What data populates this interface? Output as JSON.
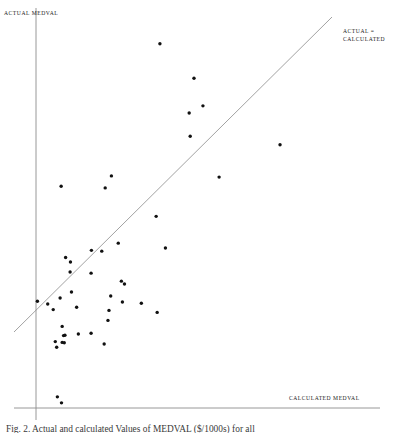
{
  "figure": {
    "background_color": "#ffffff",
    "ink_color": "#1a1a1a",
    "axis_color": "#888888",
    "caption": "Fig. 2. Actual and calculated Values of MEDVAL ($/1000s) for all"
  },
  "chart_data": {
    "type": "scatter",
    "title": "",
    "xlabel": "CALCULATED MEDVAL",
    "ylabel": "ACTUAL MEDVAL",
    "xlim": [
      0,
      100
    ],
    "ylim": [
      0,
      100
    ],
    "grid": false,
    "legend_position": "upper-right-inline",
    "marker": {
      "shape": "circle",
      "color": "#111111",
      "size_px": 3.4
    },
    "reference_line": {
      "label": "ACTUAL = CALCULATED",
      "type": "identity",
      "slope": 1,
      "intercept": 0,
      "color": "#8a8a8a",
      "x_start": -6.4,
      "y_start": 19.0,
      "x_end": 86.0,
      "y_end": 97.7
    },
    "axes": {
      "x_axis_start_px": 14,
      "x_axis_end_px": 380,
      "x_axis_y_px": 408,
      "y_axis_x_px": 36,
      "y_axis_top_px": 8,
      "y_axis_bottom_px": 420
    },
    "n_points": 56,
    "points": [
      {
        "x": 36.0,
        "y": 91.0
      },
      {
        "x": 45.9,
        "y": 82.4
      },
      {
        "x": 48.5,
        "y": 75.5
      },
      {
        "x": 44.5,
        "y": 73.7
      },
      {
        "x": 44.8,
        "y": 67.9
      },
      {
        "x": 70.9,
        "y": 65.8
      },
      {
        "x": 53.2,
        "y": 57.7
      },
      {
        "x": 21.9,
        "y": 58.0
      },
      {
        "x": 7.3,
        "y": 55.4
      },
      {
        "x": 20.1,
        "y": 55.0
      },
      {
        "x": 34.9,
        "y": 47.9
      },
      {
        "x": 23.9,
        "y": 41.2
      },
      {
        "x": 37.6,
        "y": 40.0
      },
      {
        "x": 16.1,
        "y": 39.4
      },
      {
        "x": 19.1,
        "y": 39.2
      },
      {
        "x": 8.6,
        "y": 37.6
      },
      {
        "x": 10.0,
        "y": 36.5
      },
      {
        "x": 9.9,
        "y": 34.0
      },
      {
        "x": 16.0,
        "y": 33.7
      },
      {
        "x": 24.8,
        "y": 31.7
      },
      {
        "x": 25.7,
        "y": 31.0
      },
      {
        "x": 10.3,
        "y": 29.0
      },
      {
        "x": 7.0,
        "y": 27.5
      },
      {
        "x": 21.7,
        "y": 28.0
      },
      {
        "x": 25.1,
        "y": 26.5
      },
      {
        "x": 30.6,
        "y": 26.2
      },
      {
        "x": 0.4,
        "y": 26.7
      },
      {
        "x": 3.4,
        "y": 26.0
      },
      {
        "x": 11.8,
        "y": 25.2
      },
      {
        "x": 5.0,
        "y": 24.6
      },
      {
        "x": 21.2,
        "y": 24.4
      },
      {
        "x": 35.2,
        "y": 23.9
      },
      {
        "x": 20.9,
        "y": 21.9
      },
      {
        "x": 7.6,
        "y": 20.4
      },
      {
        "x": 12.3,
        "y": 18.5
      },
      {
        "x": 16.0,
        "y": 18.7
      },
      {
        "x": 8.0,
        "y": 18.1
      },
      {
        "x": 8.4,
        "y": 18.2
      },
      {
        "x": 5.6,
        "y": 16.6
      },
      {
        "x": 7.6,
        "y": 16.4
      },
      {
        "x": 8.2,
        "y": 16.3
      },
      {
        "x": 19.8,
        "y": 16.0
      },
      {
        "x": 6.0,
        "y": 15.2
      },
      {
        "x": 6.2,
        "y": 2.8
      },
      {
        "x": 7.4,
        "y": 1.3
      }
    ]
  }
}
